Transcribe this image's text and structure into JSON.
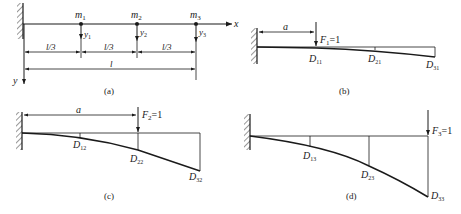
{
  "figure": {
    "panels": [
      {
        "id": "a",
        "caption": "(a)",
        "masses": [
          {
            "label": "m",
            "sub": "1"
          },
          {
            "label": "m",
            "sub": "2"
          },
          {
            "label": "m",
            "sub": "3"
          }
        ],
        "displacements": [
          {
            "label": "y",
            "sub": "1"
          },
          {
            "label": "y",
            "sub": "2"
          },
          {
            "label": "y",
            "sub": "3"
          }
        ],
        "segments": [
          "l/3",
          "l/3",
          "l/3"
        ],
        "total_length": "l",
        "x_axis": "x",
        "y_axis": "y"
      },
      {
        "id": "b",
        "caption": "(b)",
        "distance": "a",
        "force": {
          "label": "F",
          "sub": "1",
          "value": "=1"
        },
        "deflections": [
          {
            "label": "D",
            "sub": "11"
          },
          {
            "label": "D",
            "sub": "21"
          },
          {
            "label": "D",
            "sub": "31"
          }
        ]
      },
      {
        "id": "c",
        "caption": "(c)",
        "distance": "a",
        "force": {
          "label": "F",
          "sub": "2",
          "value": "=1"
        },
        "deflections": [
          {
            "label": "D",
            "sub": "12"
          },
          {
            "label": "D",
            "sub": "22"
          },
          {
            "label": "D",
            "sub": "32"
          }
        ]
      },
      {
        "id": "d",
        "caption": "(d)",
        "force": {
          "label": "F",
          "sub": "3",
          "value": "=1"
        },
        "deflections": [
          {
            "label": "D",
            "sub": "13"
          },
          {
            "label": "D",
            "sub": "23"
          },
          {
            "label": "D",
            "sub": "33"
          }
        ]
      }
    ]
  }
}
